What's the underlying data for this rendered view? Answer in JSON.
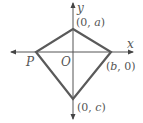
{
  "diagram": {
    "type": "coordinate-quadrilateral",
    "axes": {
      "x_label": "x",
      "y_label": "y",
      "origin_label": "O"
    },
    "points": {
      "top": {
        "label_open": "(0, ",
        "var": "a",
        "label_close": ")"
      },
      "right": {
        "label_open": "(",
        "var": "b",
        "label_close": ", 0)"
      },
      "bottom": {
        "label_open": "(0, ",
        "var": "c",
        "label_close": ")"
      },
      "left": {
        "label": "P"
      }
    },
    "colors": {
      "shape_stroke": "#555555",
      "axis_stroke": "#555555",
      "label": "#555555"
    }
  }
}
